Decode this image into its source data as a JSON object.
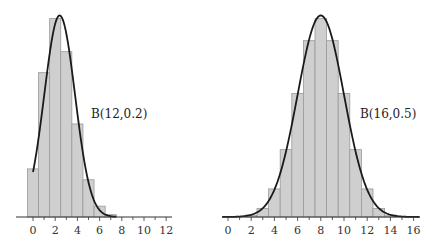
{
  "chart_data": [
    {
      "type": "bar",
      "title": "",
      "xlabel": "",
      "ylabel": "",
      "annotation": "B(12,0.2)",
      "distribution": {
        "n": 12,
        "p": 0.2
      },
      "categories": [
        0,
        1,
        2,
        3,
        4,
        5,
        6,
        7,
        8,
        9,
        10,
        11,
        12
      ],
      "values": [
        0.0687,
        0.2062,
        0.2835,
        0.2362,
        0.1329,
        0.0532,
        0.0155,
        0.0033,
        0.0005,
        0.0001,
        0.0,
        0.0,
        0.0
      ],
      "overlay_curve": {
        "type": "line",
        "name": "normal approximation",
        "mean": 2.4,
        "sd": 1.386,
        "x_range": [
          0,
          7.5
        ]
      },
      "xlim": [
        -1.5,
        12.5
      ],
      "ylim": [
        0,
        0.3
      ],
      "xticks": [
        0,
        2,
        4,
        6,
        8,
        10,
        12
      ],
      "xtick_labels": [
        "0",
        "2",
        "4",
        "6",
        "8",
        "10",
        "12"
      ],
      "grid": false
    },
    {
      "type": "bar",
      "title": "",
      "xlabel": "",
      "ylabel": "",
      "annotation": "B(16,0.5)",
      "distribution": {
        "n": 16,
        "p": 0.5
      },
      "categories": [
        0,
        1,
        2,
        3,
        4,
        5,
        6,
        7,
        8,
        9,
        10,
        11,
        12,
        13,
        14,
        15,
        16
      ],
      "values": [
        0.0,
        0.0002,
        0.0018,
        0.0085,
        0.0278,
        0.0667,
        0.1222,
        0.1746,
        0.1964,
        0.1746,
        0.1222,
        0.0667,
        0.0278,
        0.0085,
        0.0018,
        0.0002,
        0.0
      ],
      "overlay_curve": {
        "type": "line",
        "name": "normal approximation",
        "mean": 8,
        "sd": 2,
        "x_range": [
          -0.5,
          16.5
        ]
      },
      "xlim": [
        -0.5,
        16.5
      ],
      "ylim": [
        0,
        0.21
      ],
      "xticks": [
        0,
        2,
        4,
        6,
        8,
        10,
        12,
        14,
        16
      ],
      "xtick_labels": [
        "0",
        "2",
        "4",
        "6",
        "8",
        "10",
        "12",
        "14",
        "16"
      ],
      "grid": false
    }
  ]
}
